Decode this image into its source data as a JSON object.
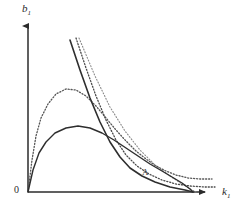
{
  "figure": {
    "background_color": "#ffffff",
    "width": 242,
    "height": 216
  },
  "axes": {
    "origin_label": "0",
    "y_label_base": "b",
    "y_label_sub": "1",
    "x_label_base": "k",
    "x_label_sub": "1",
    "axis_color": "#2b2b2b",
    "origin_px": [
      28,
      192
    ],
    "y_top_px": [
      28,
      22
    ],
    "x_right_px": [
      210,
      192
    ]
  },
  "annotations": [
    {
      "name": "point-a",
      "text": "A",
      "x": 142,
      "y": 168,
      "color": "#3a3a3a"
    }
  ],
  "chart_data": {
    "type": "line",
    "title": "",
    "xlabel": "k_1",
    "ylabel": "b_1",
    "xlim": [
      0,
      242
    ],
    "ylim": [
      0,
      216
    ],
    "grid": false,
    "legend": "none",
    "axis_origin": [
      28,
      192
    ],
    "series": [
      {
        "name": "solid-hump-curve",
        "style": "solid",
        "color": "#2e2e2e",
        "width": 1.4,
        "points": [
          [
            28,
            192
          ],
          [
            33,
            170
          ],
          [
            39,
            153
          ],
          [
            46,
            142
          ],
          [
            55,
            133
          ],
          [
            66,
            128
          ],
          [
            78,
            126
          ],
          [
            90,
            128
          ],
          [
            102,
            133
          ],
          [
            114,
            140
          ],
          [
            126,
            148
          ],
          [
            138,
            156
          ],
          [
            150,
            164
          ],
          [
            162,
            171
          ],
          [
            172,
            177
          ],
          [
            182,
            183
          ],
          [
            190,
            189
          ],
          [
            193,
            192
          ]
        ]
      },
      {
        "name": "dotted-hump-curve",
        "style": "dotted",
        "color": "#555555",
        "width": 1.3,
        "points": [
          [
            28,
            192
          ],
          [
            32,
            160
          ],
          [
            36,
            136
          ],
          [
            41,
            118
          ],
          [
            48,
            104
          ],
          [
            56,
            94
          ],
          [
            66,
            89
          ],
          [
            76,
            90
          ],
          [
            86,
            96
          ],
          [
            96,
            106
          ],
          [
            106,
            118
          ],
          [
            116,
            130
          ],
          [
            126,
            141
          ],
          [
            136,
            151
          ],
          [
            146,
            159
          ],
          [
            156,
            166
          ],
          [
            166,
            171
          ],
          [
            176,
            175
          ],
          [
            188,
            178
          ],
          [
            200,
            179
          ],
          [
            212,
            179
          ]
        ]
      },
      {
        "name": "steep-solid-descending-line",
        "style": "solid",
        "color": "#2e2e2e",
        "width": 1.6,
        "points": [
          [
            70,
            40
          ],
          [
            80,
            70
          ],
          [
            90,
            98
          ],
          [
            100,
            122
          ],
          [
            110,
            142
          ],
          [
            120,
            157
          ],
          [
            130,
            168
          ],
          [
            142,
            176
          ],
          [
            155,
            182
          ],
          [
            170,
            187
          ],
          [
            185,
            190
          ],
          [
            193,
            192
          ]
        ]
      },
      {
        "name": "steep-dotted-descending-line",
        "style": "dotted",
        "color": "#4a4a4a",
        "width": 1.3,
        "points": [
          [
            76,
            38
          ],
          [
            86,
            68
          ],
          [
            96,
            96
          ],
          [
            106,
            120
          ],
          [
            116,
            140
          ],
          [
            126,
            155
          ],
          [
            137,
            166
          ],
          [
            149,
            174
          ],
          [
            162,
            180
          ],
          [
            176,
            184
          ],
          [
            190,
            186
          ],
          [
            205,
            187
          ],
          [
            215,
            187
          ]
        ]
      },
      {
        "name": "faint-dotted-diagonal-line",
        "style": "dotted",
        "color": "#8a8a8a",
        "width": 1.1,
        "points": [
          [
            79,
            38
          ],
          [
            95,
            76
          ],
          [
            110,
            107
          ],
          [
            125,
            131
          ],
          [
            140,
            150
          ],
          [
            155,
            165
          ],
          [
            170,
            176
          ],
          [
            182,
            184
          ],
          [
            192,
            190
          ],
          [
            196,
            192
          ]
        ]
      }
    ]
  }
}
